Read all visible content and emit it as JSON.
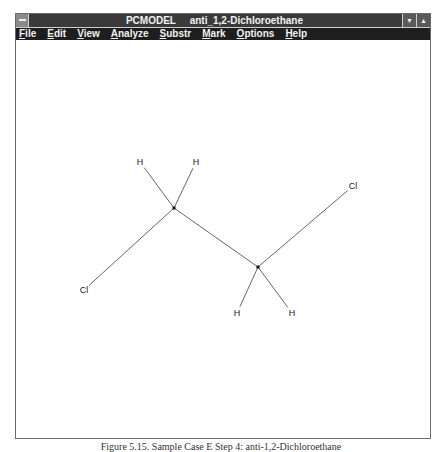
{
  "window": {
    "app_name": "PCMODEL",
    "document_name": "anti_1,2-Dichloroethane",
    "title": "PCMODEL     anti_1,2-Dichloroethane",
    "buttons": {
      "minimize": "▼",
      "maximize": "▲"
    }
  },
  "menubar": {
    "items": [
      {
        "label": "File",
        "mnemonic": "F"
      },
      {
        "label": "Edit",
        "mnemonic": "E"
      },
      {
        "label": "View",
        "mnemonic": "V"
      },
      {
        "label": "Analyze",
        "mnemonic": "A"
      },
      {
        "label": "Substr",
        "mnemonic": "S"
      },
      {
        "label": "Mark",
        "mnemonic": "M"
      },
      {
        "label": "Options",
        "mnemonic": "O"
      },
      {
        "label": "Help",
        "mnemonic": "H"
      }
    ]
  },
  "molecule": {
    "name": "anti-1,2-Dichloroethane",
    "atoms": [
      {
        "id": "C1",
        "label": "",
        "x": 174,
        "y": 208
      },
      {
        "id": "C2",
        "label": "",
        "x": 258,
        "y": 267
      },
      {
        "id": "H1",
        "label": "H",
        "x": 140,
        "y": 162
      },
      {
        "id": "H2",
        "label": "H",
        "x": 196,
        "y": 162
      },
      {
        "id": "Cl1",
        "label": "Cl",
        "x": 84,
        "y": 290
      },
      {
        "id": "Cl2",
        "label": "Cl",
        "x": 353,
        "y": 186
      },
      {
        "id": "H3",
        "label": "H",
        "x": 237,
        "y": 313
      },
      {
        "id": "H4",
        "label": "H",
        "x": 292,
        "y": 313
      }
    ],
    "bonds": [
      [
        "C1",
        "C2"
      ],
      [
        "C1",
        "H1"
      ],
      [
        "C1",
        "H2"
      ],
      [
        "C1",
        "Cl1"
      ],
      [
        "C2",
        "Cl2"
      ],
      [
        "C2",
        "H3"
      ],
      [
        "C2",
        "H4"
      ]
    ]
  },
  "caption": "Figure 5.15. Sample Case E Step 4: anti-1,2-Dichloroethane"
}
